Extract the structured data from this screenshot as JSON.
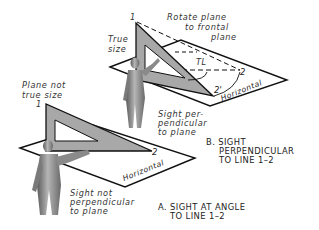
{
  "figure": {
    "upper": {
      "labels": {
        "rotate_line1": "Rotate plane",
        "rotate_line2": "to frontal",
        "rotate_line3": "plane",
        "true_line1": "True",
        "true_line2": "size",
        "tl": "TL",
        "point1": "1",
        "point2": "2",
        "point2_prime": "2'",
        "horizontal": "Horizontal",
        "sight_line1": "Sight per-",
        "sight_line2": "pendicular",
        "sight_line3": "to plane"
      },
      "caption": {
        "line1": "B. SIGHT",
        "line2": "PERPENDICULAR",
        "line3": "TO LINE 1–2"
      }
    },
    "lower": {
      "labels": {
        "plane_line1": "Plane not",
        "plane_line2": "true size",
        "point1": "1",
        "point2": "2",
        "horizontal": "Horizontal",
        "sight_line1": "Sight not",
        "sight_line2": "perpendicular",
        "sight_line3": "to plane"
      },
      "caption": {
        "line1": "A. SIGHT AT ANGLE",
        "line2": "TO LINE 1–2"
      }
    },
    "colors": {
      "line": "#111111",
      "triangle_fill": "#a8a8a8",
      "figure_fill": "#8a8a8a",
      "text": "#333333"
    }
  }
}
